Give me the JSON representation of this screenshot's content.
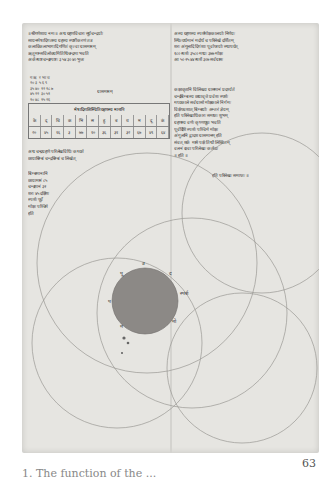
{
  "page": {
    "page_number": "63",
    "caption": "1. The function of the ...",
    "colors": {
      "paper": "#e6e5e1",
      "ink": "#3a3a3a",
      "disk": "#8c8986",
      "circle_lines": "#9a9894"
    }
  },
  "manuscript": {
    "top_left_lines": [
      "॥श्रीगणेशाय नमः॥ अथ ग्रहणविचारः सूर्यचन्द्रयोः",
      "सायनमेषादिगतस्य ग्रहस्य स्पष्टीकरणं तत्र",
      "कलाविकलाभागादि गणितं कृत्वा ग्रासमानम्",
      "ऋतुमान्सविलोक्यमितिथिचन्द्रमा भवति",
      "अर्कस्पष्टचन्द्रस्पष्टः ३ ५४ ३० ४० भुजः"
    ],
    "top_right_lines": [
      "अस्य ग्रहणस्य स्पर्शमोक्षकालयोः निर्णयः",
      "स्थित्यर्धमानं मर्दार्धं च परिलेखे दर्शितम्",
      "शरः अंगुलादि दिगंशाः पूर्वापरयोः स्थापयेत्",
      "१८० स्पर्शः ३५८० मध्यः ३७७ मोक्षः",
      "आ ५० २५ ४४ स्पर्शे ३०७ सर्वग्रासः"
    ],
    "right_column_lines": [
      "कक्षावृत्तानि विलिख्य ग्रासमानं प्रदर्श्यते",
      "चन्द्रबिम्बस्य छायावृत्ते प्रवेशः स्पर्शः",
      "मध्यकाले सर्वग्रासो मोक्षकाले निर्गमः",
      "विक्षेपवशात् बिम्बयोः अन्तरं ज्ञेयम्",
      "इति परिलेखाधिकारः समाप्तः शुभम्",
      "ग्रहणस्य वर्णः कृष्णधूम्रः भवति",
      "पूर्वदिशि स्पर्शः पश्चिमे मोक्षः",
      "अंगुलानि द्वादश ग्रासमानम् इति",
      "संवत् शके मासे पक्षे तिथौ लिखितम्",
      "वलनं दत्त्वा परिलेखः कर्तव्यः",
      "॥ इति ॥"
    ],
    "number_grid": [
      "ग  ऋ  र  भा  च",
      "२०  ३  ५  ६  ९",
      "३५  ४०  १२  १८  ७",
      "४५  २२  ३०  ५१",
      "१०  ४८  १५  २६"
    ],
    "grid_label": "ग्रासमानम्",
    "table_header": "मेषादिराशिस्थितिग्रहणस्य मानानि",
    "table_rows": [
      [
        "के",
        "द्",
        "चि",
        "क",
        "भि",
        "स",
        "हु",
        "ब",
        "ध",
        "म",
        "दू",
        "कं"
      ],
      [
        "२०",
        "४५",
        "१६",
        "३",
        "७७",
        "१०",
        "३६",
        "३१",
        "३२",
        "६७",
        "४९",
        "६४"
      ]
    ],
    "left_column_lines": [
      "अथ चन्द्रग्रहणे परिलेखविधिः कथ्यते",
      "छायाबिम्बं चन्द्रबिम्बं च लिखेत्"
    ],
    "left_side_lines": [
      "बिम्बमानानि",
      "छायामानं ८५",
      "चन्द्रमानं ३२",
      "शरः ४५ दक्षिणः",
      "स्पर्शः पूर्वे",
      "मोक्षः पश्चिमे",
      "इति"
    ],
    "right_bottom_lines": [
      "इति परिलेखः समाप्तः ॥"
    ],
    "diagram_labels": [
      "उ",
      "पू",
      "प",
      "द",
      "स्पर्श",
      "मो",
      "म"
    ]
  }
}
